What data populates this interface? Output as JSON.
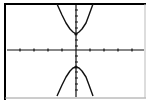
{
  "chart_data": {
    "type": "line",
    "title": "",
    "xlabel": "",
    "ylabel": "",
    "grid": false,
    "legend": [],
    "axes": {
      "x_ticks_px": [
        20,
        34,
        48,
        62,
        90,
        104,
        118,
        132
      ],
      "y_ticks_px": [
        10,
        16,
        22,
        28,
        40,
        46,
        56,
        62,
        72,
        78,
        84,
        90
      ],
      "origin_px": [
        76,
        50
      ]
    },
    "series": [
      {
        "name": "upper-branch",
        "vertex_px": [
          76,
          34
        ],
        "points_px": [
          [
            57,
            4
          ],
          [
            62,
            15
          ],
          [
            66,
            23
          ],
          [
            70,
            29
          ],
          [
            73,
            32
          ],
          [
            76,
            34
          ],
          [
            79,
            32
          ],
          [
            82,
            29
          ],
          [
            86,
            23
          ],
          [
            89,
            15
          ],
          [
            93,
            4
          ]
        ]
      },
      {
        "name": "lower-branch",
        "vertex_px": [
          76,
          67
        ],
        "points_px": [
          [
            57,
            96
          ],
          [
            62,
            85
          ],
          [
            66,
            77
          ],
          [
            70,
            71
          ],
          [
            73,
            68
          ],
          [
            76,
            67
          ],
          [
            79,
            68
          ],
          [
            82,
            71
          ],
          [
            86,
            77
          ],
          [
            89,
            85
          ],
          [
            93,
            96
          ]
        ]
      }
    ]
  },
  "colors": {
    "background": "#ffffff",
    "ink": "#111111",
    "frame_dark": "#000000",
    "frame_light": "#9a9a9a"
  }
}
